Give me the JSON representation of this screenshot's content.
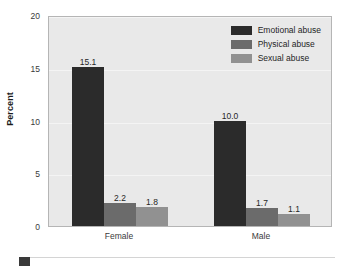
{
  "chart_data": {
    "type": "bar",
    "title": "",
    "subtitle": "",
    "xlabel": "",
    "ylabel": "Percent",
    "categories": [
      "Female",
      "Male"
    ],
    "series": [
      {
        "name": "Emotional abuse",
        "color": "#2b2b2b",
        "values": [
          15.1,
          10.0
        ],
        "labels": [
          "15.1",
          "10.0"
        ]
      },
      {
        "name": "Physical abuse",
        "color": "#6b6b6b",
        "values": [
          2.2,
          1.7
        ],
        "labels": [
          "2.2",
          "1.7"
        ]
      },
      {
        "name": "Sexual abuse",
        "color": "#919191",
        "values": [
          1.8,
          1.1
        ],
        "labels": [
          "1.8",
          "1.1"
        ]
      }
    ],
    "ylim": [
      0,
      20
    ],
    "yticks": [
      0,
      5,
      10,
      15,
      20
    ],
    "ytick_labels": [
      "0",
      "5",
      "10",
      "15",
      "20"
    ],
    "grid": true,
    "grid_color": "#f4f4f4",
    "legend_position": "top-right",
    "plot_background": "#e9e9e9",
    "page_background": "#ffffff",
    "frame_color": "#b5b5b5"
  },
  "footer": {
    "swatch_color": "#3a3a3a",
    "rule_color": "#d4d4d4"
  }
}
